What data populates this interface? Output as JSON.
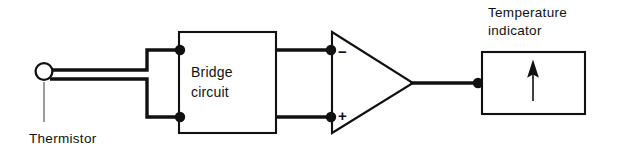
{
  "figure": {
    "background_color": "#ffffff",
    "line_color": "#111111"
  },
  "components": {
    "thermistor": {
      "label": "Thermistor",
      "symbol": "open-circle",
      "leads": 2
    },
    "bridge": {
      "label_line1": "Bridge",
      "label_line2": "circuit",
      "shape": "rectangle"
    },
    "amplifier": {
      "shape": "triangle",
      "inverting_input_label": "−",
      "noninverting_input_label": "+"
    },
    "indicator": {
      "label_line1": "Temperature",
      "label_line2": "indicator",
      "shape": "rectangle",
      "needle": "up-arrow"
    }
  },
  "connections": [
    {
      "from": "thermistor",
      "to": "bridge",
      "terminal": "top"
    },
    {
      "from": "thermistor",
      "to": "bridge",
      "terminal": "bottom"
    },
    {
      "from": "bridge",
      "to": "amplifier",
      "terminal": "inverting"
    },
    {
      "from": "bridge",
      "to": "amplifier",
      "terminal": "noninverting"
    },
    {
      "from": "amplifier",
      "to": "indicator",
      "terminal": "output"
    }
  ]
}
